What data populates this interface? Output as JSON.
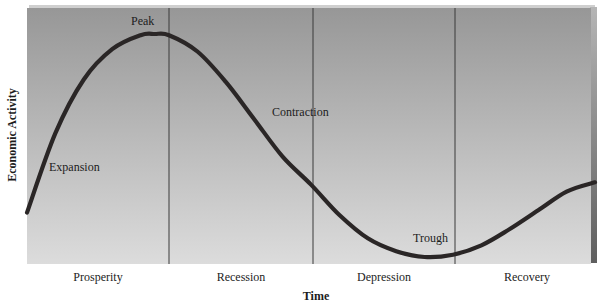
{
  "chart_data": {
    "type": "line",
    "title": "",
    "xlabel": "Time",
    "ylabel": "Economic Activity",
    "grid": false,
    "phases": [
      "Prosperity",
      "Recession",
      "Depression",
      "Recovery"
    ],
    "annotations": [
      {
        "text": "Peak",
        "x": 0.215,
        "y": 0.97
      },
      {
        "text": "Expansion",
        "x": 0.04,
        "y": 0.38
      },
      {
        "text": "Contraction",
        "x": 0.43,
        "y": 0.64
      },
      {
        "text": "Trough",
        "x": 0.71,
        "y": 0.06
      }
    ],
    "x": [
      0.0,
      0.05,
      0.1,
      0.15,
      0.2,
      0.225,
      0.25,
      0.3,
      0.35,
      0.4,
      0.45,
      0.5,
      0.55,
      0.6,
      0.65,
      0.7,
      0.75,
      0.8,
      0.85,
      0.9,
      0.95,
      1.0
    ],
    "y": [
      0.21,
      0.55,
      0.78,
      0.91,
      0.97,
      0.975,
      0.97,
      0.9,
      0.77,
      0.61,
      0.45,
      0.33,
      0.2,
      0.1,
      0.045,
      0.02,
      0.03,
      0.07,
      0.14,
      0.22,
      0.3,
      0.34
    ],
    "xlim": [
      0,
      1
    ],
    "ylim": [
      0,
      1
    ],
    "phase_boundaries": [
      0.25,
      0.5,
      0.75
    ]
  },
  "colors": {
    "panel_top": "#979797",
    "panel_bottom": "#dcdcdc",
    "curve": "#2a2626",
    "divider": "#3a3a3a",
    "bevel": "#6e6e6e"
  }
}
